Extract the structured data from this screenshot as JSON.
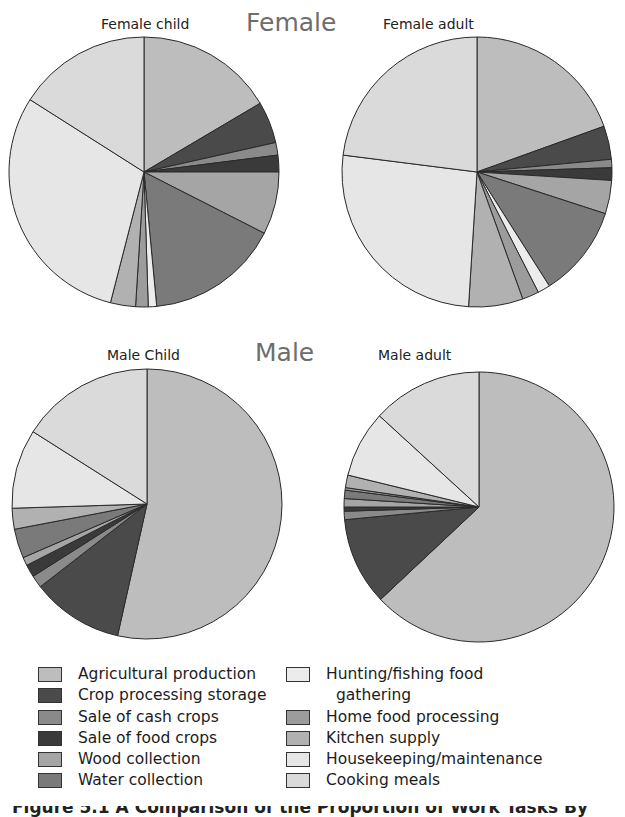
{
  "groups": {
    "female": "Female",
    "male": "Male"
  },
  "pies": [
    {
      "id": "female-child",
      "title": "Female child"
    },
    {
      "id": "female-adult",
      "title": "Female adult"
    },
    {
      "id": "male-child",
      "title": "Male Child"
    },
    {
      "id": "male-adult",
      "title": "Male adult"
    }
  ],
  "legend": {
    "left": [
      {
        "label": "Agricultural production",
        "color": "#bdbdbd"
      },
      {
        "label": "Crop processing storage",
        "color": "#4a4a4a"
      },
      {
        "label": "Sale of cash crops",
        "color": "#8a8a8a"
      },
      {
        "label": "Sale of food crops",
        "color": "#3a3a3a"
      },
      {
        "label": "Wood collection",
        "color": "#a5a5a5"
      },
      {
        "label": "Water collection",
        "color": "#7a7a7a"
      }
    ],
    "right": [
      {
        "label": "Hunting/fishing food",
        "label2": "gathering",
        "color": "#ececec"
      },
      {
        "label": "Home food processing",
        "color": "#9c9c9c"
      },
      {
        "label": "Kitchen supply",
        "color": "#b1b1b1"
      },
      {
        "label": "Housekeeping/maintenance",
        "color": "#e6e6e6"
      },
      {
        "label": "Cooking meals",
        "color": "#dadada"
      }
    ]
  },
  "caption": "Figure 5.1  A Comparison of the Proportion of Work Tasks By",
  "chart_data": [
    {
      "type": "pie",
      "title": "Female child",
      "group": "Female",
      "categories": [
        "Agricultural production",
        "Crop processing storage",
        "Sale of cash crops",
        "Sale of food crops",
        "Wood collection",
        "Water collection",
        "Hunting/fishing food gathering",
        "Home food processing",
        "Kitchen supply",
        "Housekeeping/maintenance",
        "Cooking meals"
      ],
      "values": [
        16.5,
        5,
        1.5,
        2,
        7.5,
        16,
        1,
        1.5,
        3,
        30,
        16
      ],
      "start_angle": "12 o'clock",
      "direction": "clockwise"
    },
    {
      "type": "pie",
      "title": "Female adult",
      "group": "Female",
      "categories": [
        "Agricultural production",
        "Crop processing storage",
        "Sale of cash crops",
        "Sale of food crops",
        "Wood collection",
        "Water collection",
        "Hunting/fishing food gathering",
        "Home food processing",
        "Kitchen supply",
        "Housekeeping/maintenance",
        "Cooking meals"
      ],
      "values": [
        19.5,
        4,
        1,
        1.5,
        4,
        11,
        1.5,
        2,
        6.5,
        26,
        23
      ],
      "start_angle": "12 o'clock",
      "direction": "clockwise"
    },
    {
      "type": "pie",
      "title": "Male Child",
      "group": "Male",
      "categories": [
        "Agricultural production",
        "Crop processing storage",
        "Sale of cash crops",
        "Sale of food crops",
        "Wood collection",
        "Water collection",
        "Hunting/fishing food gathering",
        "Home food processing",
        "Kitchen supply",
        "Housekeeping/maintenance",
        "Cooking meals"
      ],
      "values": [
        53.5,
        11,
        1.5,
        1.5,
        1,
        3.5,
        0,
        0,
        2.5,
        9.5,
        16
      ],
      "start_angle": "12 o'clock",
      "direction": "clockwise"
    },
    {
      "type": "pie",
      "title": "Male adult",
      "group": "Male",
      "categories": [
        "Agricultural production",
        "Crop processing storage",
        "Sale of cash crops",
        "Sale of food crops",
        "Wood collection",
        "Water collection",
        "Hunting/fishing food gathering",
        "Home food processing",
        "Kitchen supply",
        "Housekeeping/maintenance",
        "Cooking meals"
      ],
      "values": [
        63,
        10.5,
        1,
        0.5,
        1,
        1,
        0,
        0.3,
        1.5,
        8,
        13.2
      ],
      "start_angle": "12 o'clock",
      "direction": "clockwise"
    }
  ]
}
